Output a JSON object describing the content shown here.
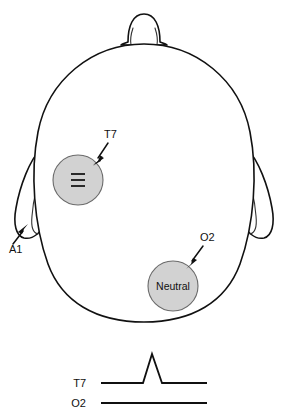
{
  "figure": {
    "background_color": "#ffffff",
    "line_color": "#111111",
    "electrode_fill_color": "#d2d2d2",
    "electrode_stroke_color": "#6a6a6a"
  },
  "head": {
    "nose_label": "nose",
    "left_ear_label": "left ear",
    "right_ear_label": "right ear"
  },
  "electrodes": [
    {
      "id": "t7",
      "label": "T7",
      "inner_text": "",
      "icon": "three-bars-icon",
      "cx": 78,
      "cy": 180,
      "r": 25,
      "fill": "#d2d2d2"
    },
    {
      "id": "o2",
      "label": "O2",
      "inner_text": "Neutral",
      "icon": "",
      "cx": 173,
      "cy": 286,
      "r": 25,
      "fill": "#d2d2d2"
    }
  ],
  "annotations": [
    {
      "id": "t7-callout",
      "label": "T7",
      "label_x": 104,
      "label_y": 138,
      "line_from_x": 108,
      "line_from_y": 143,
      "line_to_x": 95,
      "line_to_y": 162
    },
    {
      "id": "a1-callout",
      "label": "A1",
      "label_x": 9,
      "label_y": 253,
      "line_from_x": 13,
      "line_from_y": 244,
      "line_to_x": 26,
      "line_to_y": 226
    },
    {
      "id": "o2-callout",
      "label": "O2",
      "label_x": 200,
      "label_y": 241,
      "line_from_x": 203,
      "line_from_y": 246,
      "line_to_x": 188,
      "line_to_y": 265
    }
  ],
  "traces": {
    "axis_note": "signal traces below head diagram",
    "items": [
      {
        "id": "trace-t7",
        "label": "T7",
        "label_x": 86,
        "label_y": 387,
        "waveform": "spike",
        "baseline_y": 383,
        "peak_y": 354,
        "x_start": 101,
        "x_end": 207,
        "spike_start_x": 143,
        "spike_peak_x": 152,
        "spike_end_x": 162
      },
      {
        "id": "trace-o2",
        "label": "O2",
        "label_x": 86,
        "label_y": 407,
        "waveform": "flat",
        "baseline_y": 403,
        "x_start": 101,
        "x_end": 207
      }
    ]
  }
}
